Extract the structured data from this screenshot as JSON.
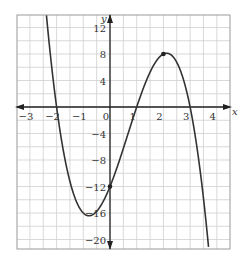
{
  "chart_data": {
    "type": "line",
    "title": "",
    "xlabel": "x",
    "ylabel": "y",
    "xlim": [
      -3.5,
      4.5
    ],
    "ylim": [
      -22,
      14
    ],
    "grid": true,
    "x_ticks": [
      -3,
      -2,
      -1,
      0,
      1,
      2,
      3,
      4
    ],
    "y_ticks": [
      12,
      8,
      4,
      -4,
      -8,
      -12,
      -16,
      -20
    ],
    "function": "y = -2(x+2)(x-1)(x-3)",
    "series": [
      {
        "name": "cubic",
        "x": [
          -2.4,
          -2,
          -1.5,
          -1,
          -0.5,
          0,
          0.5,
          1,
          1.5,
          2,
          2.5,
          3,
          3.3
        ],
        "y": [
          13.3,
          0,
          -10.5,
          -16,
          -15.75,
          -12,
          -6.25,
          0,
          5.25,
          8,
          6.75,
          0,
          -10.0
        ]
      }
    ],
    "marked_points": [
      {
        "x": 2,
        "y": 8,
        "label": "maximum"
      },
      {
        "x": 0,
        "y": -12,
        "label": "y-intercept"
      }
    ],
    "tick_labels": {
      "x": [
        "−3",
        "−2",
        "−1",
        "0",
        "1",
        "2",
        "3",
        "4"
      ],
      "y": [
        "12",
        "8",
        "4",
        "−4",
        "−8",
        "−12",
        "−16",
        "−20"
      ]
    }
  },
  "axis_labels": {
    "x": "x",
    "y": "y"
  },
  "colors": {
    "grid": "#cfcfcf",
    "border": "#999999",
    "axis": "#222222",
    "curve": "#333333"
  }
}
